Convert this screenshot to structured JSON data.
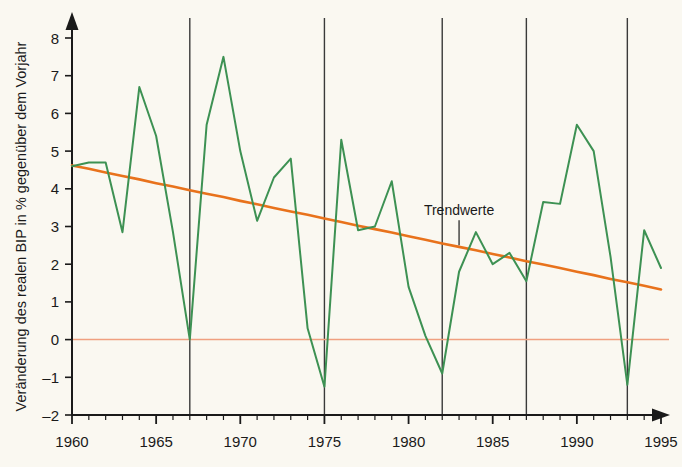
{
  "chart_data": {
    "type": "line",
    "title": "",
    "xlabel": "",
    "ylabel": "Veränderung des realen BIP in % gegenüber dem Vorjahr",
    "xlim": [
      1960,
      1995
    ],
    "ylim": [
      -2,
      8.6
    ],
    "grid": false,
    "legend": "none",
    "x": [
      1960,
      1961,
      1962,
      1963,
      1964,
      1965,
      1966,
      1967,
      1968,
      1969,
      1970,
      1971,
      1972,
      1973,
      1974,
      1975,
      1976,
      1977,
      1978,
      1979,
      1980,
      1981,
      1982,
      1983,
      1984,
      1985,
      1986,
      1987,
      1988,
      1989,
      1990,
      1991,
      1992,
      1993,
      1994,
      1995
    ],
    "series": [
      {
        "name": "Veränderung des realen BIP",
        "color": "#3d9153",
        "values": [
          4.6,
          4.7,
          4.7,
          2.85,
          6.7,
          5.4,
          2.85,
          0.0,
          5.7,
          7.5,
          5.0,
          3.15,
          4.3,
          4.8,
          0.3,
          -1.25,
          5.3,
          2.9,
          3.0,
          4.2,
          1.4,
          0.1,
          -0.9,
          1.8,
          2.85,
          2.0,
          2.3,
          1.55,
          3.65,
          3.6,
          5.7,
          5.0,
          2.2,
          -1.2,
          2.9,
          1.9
        ]
      },
      {
        "name": "Trendwerte",
        "color": "#e8721c",
        "values": [
          4.62,
          4.53,
          4.43,
          4.34,
          4.25,
          4.15,
          4.06,
          3.96,
          3.87,
          3.78,
          3.68,
          3.59,
          3.49,
          3.4,
          3.31,
          3.21,
          3.12,
          3.02,
          2.93,
          2.84,
          2.74,
          2.65,
          2.55,
          2.46,
          2.37,
          2.27,
          2.18,
          2.08,
          1.99,
          1.9,
          1.8,
          1.71,
          1.61,
          1.52,
          1.43,
          1.33
        ]
      }
    ],
    "zero_line": {
      "name": "zero-reference-line",
      "value": 0,
      "color": "#f0a080"
    },
    "y_ticks": [
      -2,
      -1,
      0,
      1,
      2,
      3,
      4,
      5,
      6,
      7,
      8
    ],
    "y_tick_labels": [
      "-2",
      "-1",
      "0",
      "1",
      "2",
      "3",
      "4",
      "5",
      "6",
      "7",
      "8"
    ],
    "x_ticks": [
      1960,
      1961,
      1962,
      1963,
      1964,
      1965,
      1966,
      1967,
      1968,
      1969,
      1970,
      1971,
      1972,
      1973,
      1974,
      1975,
      1976,
      1977,
      1978,
      1979,
      1980,
      1981,
      1982,
      1983,
      1984,
      1985,
      1986,
      1987,
      1988,
      1989,
      1990,
      1991,
      1992,
      1993,
      1994,
      1995
    ],
    "x_tick_labels": [
      "1960",
      "1965",
      "1970",
      "1975",
      "1980",
      "1985",
      "1990",
      "1995"
    ],
    "x_labeled_ticks": [
      1960,
      1965,
      1970,
      1975,
      1980,
      1985,
      1990,
      1995
    ],
    "vertical_markers": [
      1967,
      1975,
      1982,
      1987,
      1993
    ],
    "vertical_marker_color": "#3a3a3a",
    "annotations": [
      {
        "name": "trendwerte-label",
        "text": "Trendwerte",
        "x": 1983.0,
        "y": 3.3,
        "leader_to_y": 2.5
      }
    ],
    "background_color": "#faf8f1",
    "axis_color": "#1a1a1a"
  }
}
